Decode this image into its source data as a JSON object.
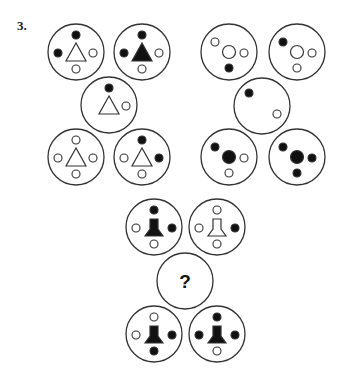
{
  "puzzle": {
    "number_label": "3.",
    "question_mark": "?",
    "colors": {
      "stroke": "#333333",
      "fill_black": "#111111",
      "fill_white": "#ffffff"
    },
    "cell_radius": 28,
    "groups": [
      {
        "name": "triangle-group",
        "cells": [
          {
            "id": "tl-1",
            "cx": 76,
            "cy": 52,
            "center": {
              "shape": "triangle",
              "fill": "white"
            },
            "dots": [
              {
                "pos": "top",
                "fill": "black"
              },
              {
                "pos": "left",
                "fill": "black"
              },
              {
                "pos": "right",
                "fill": "white"
              },
              {
                "pos": "bottom",
                "fill": "white"
              }
            ]
          },
          {
            "id": "tl-2",
            "cx": 142,
            "cy": 52,
            "center": {
              "shape": "triangle",
              "fill": "black"
            },
            "dots": [
              {
                "pos": "top",
                "fill": "black"
              },
              {
                "pos": "left",
                "fill": "black"
              },
              {
                "pos": "right",
                "fill": "white"
              },
              {
                "pos": "bottom",
                "fill": "white"
              }
            ]
          },
          {
            "id": "tl-3",
            "cx": 109,
            "cy": 105,
            "center": {
              "shape": "triangle",
              "fill": "white"
            },
            "dots": [
              {
                "pos": "top",
                "fill": "black"
              },
              {
                "pos": "right",
                "fill": "white"
              }
            ]
          },
          {
            "id": "tl-4",
            "cx": 76,
            "cy": 157,
            "center": {
              "shape": "triangle",
              "fill": "white"
            },
            "dots": [
              {
                "pos": "top",
                "fill": "white"
              },
              {
                "pos": "left",
                "fill": "white"
              },
              {
                "pos": "right",
                "fill": "white"
              },
              {
                "pos": "bottom",
                "fill": "white"
              }
            ]
          },
          {
            "id": "tl-5",
            "cx": 142,
            "cy": 157,
            "center": {
              "shape": "triangle",
              "fill": "white"
            },
            "dots": [
              {
                "pos": "top",
                "fill": "black"
              },
              {
                "pos": "left",
                "fill": "white"
              },
              {
                "pos": "right",
                "fill": "black"
              },
              {
                "pos": "bottom",
                "fill": "white"
              }
            ]
          }
        ]
      },
      {
        "name": "circle-group",
        "cells": [
          {
            "id": "tr-1",
            "cx": 229,
            "cy": 52,
            "center": {
              "shape": "circle",
              "fill": "white"
            },
            "dots": [
              {
                "pos": "topleft",
                "fill": "white"
              },
              {
                "pos": "right",
                "fill": "white"
              },
              {
                "pos": "bottom",
                "fill": "black"
              }
            ]
          },
          {
            "id": "tr-2",
            "cx": 297,
            "cy": 52,
            "center": {
              "shape": "circle",
              "fill": "white"
            },
            "dots": [
              {
                "pos": "topleft",
                "fill": "black"
              },
              {
                "pos": "right",
                "fill": "white"
              },
              {
                "pos": "bottom",
                "fill": "white"
              }
            ]
          },
          {
            "id": "tr-3",
            "cx": 262,
            "cy": 106,
            "center": {
              "shape": "none",
              "fill": "none"
            },
            "dots": [
              {
                "pos": "topleft",
                "fill": "black"
              },
              {
                "pos": "right",
                "fill": "white"
              }
            ]
          },
          {
            "id": "tr-4",
            "cx": 229,
            "cy": 157,
            "center": {
              "shape": "circle",
              "fill": "black"
            },
            "dots": [
              {
                "pos": "topleft",
                "fill": "black"
              },
              {
                "pos": "right",
                "fill": "white"
              },
              {
                "pos": "bottom",
                "fill": "white"
              }
            ]
          },
          {
            "id": "tr-5",
            "cx": 297,
            "cy": 157,
            "center": {
              "shape": "circle",
              "fill": "black"
            },
            "dots": [
              {
                "pos": "topleft",
                "fill": "black"
              },
              {
                "pos": "right",
                "fill": "black"
              },
              {
                "pos": "bottom",
                "fill": "black"
              }
            ]
          }
        ]
      },
      {
        "name": "bell-group",
        "cells": [
          {
            "id": "b-1",
            "cx": 154,
            "cy": 227,
            "center": {
              "shape": "bell",
              "fill": "black"
            },
            "dots": [
              {
                "pos": "top",
                "fill": "black"
              },
              {
                "pos": "left",
                "fill": "white"
              },
              {
                "pos": "right",
                "fill": "black"
              },
              {
                "pos": "bottom",
                "fill": "white"
              }
            ]
          },
          {
            "id": "b-2",
            "cx": 217,
            "cy": 227,
            "center": {
              "shape": "bell",
              "fill": "white"
            },
            "dots": [
              {
                "pos": "top",
                "fill": "white"
              },
              {
                "pos": "left",
                "fill": "white"
              },
              {
                "pos": "right",
                "fill": "black"
              },
              {
                "pos": "bottom",
                "fill": "white"
              }
            ]
          },
          {
            "id": "b-q",
            "cx": 185,
            "cy": 281,
            "center": {
              "shape": "question",
              "fill": "none"
            },
            "dots": []
          },
          {
            "id": "b-4",
            "cx": 154,
            "cy": 334,
            "center": {
              "shape": "bell",
              "fill": "black"
            },
            "dots": [
              {
                "pos": "top",
                "fill": "white"
              },
              {
                "pos": "left",
                "fill": "white"
              },
              {
                "pos": "right",
                "fill": "black"
              },
              {
                "pos": "bottom",
                "fill": "black"
              }
            ]
          },
          {
            "id": "b-5",
            "cx": 217,
            "cy": 334,
            "center": {
              "shape": "bell",
              "fill": "black"
            },
            "dots": [
              {
                "pos": "top",
                "fill": "black"
              },
              {
                "pos": "left",
                "fill": "black"
              },
              {
                "pos": "right",
                "fill": "black"
              },
              {
                "pos": "bottom",
                "fill": "white"
              }
            ]
          }
        ]
      }
    ]
  }
}
